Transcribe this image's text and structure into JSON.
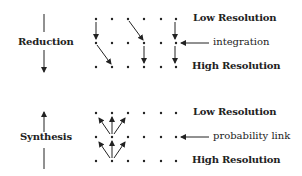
{
  "panels": [
    {
      "name": "reduction",
      "label": "Reduction",
      "arrow_direction": "down",
      "row_labels": {
        "top": "Low Resolution",
        "bottom": "High Resolution"
      },
      "annotation": "integration",
      "grid": {
        "columns": 6,
        "rows": 3
      }
    },
    {
      "name": "synthesis",
      "label": "Synthesis",
      "arrow_direction": "up",
      "row_labels": {
        "top": "Low Resolution",
        "bottom": "High Resolution"
      },
      "annotation": "probability link",
      "grid": {
        "columns": 6,
        "rows": 3
      }
    }
  ],
  "colors": {
    "ink": "#222222",
    "background": "#ffffff"
  }
}
